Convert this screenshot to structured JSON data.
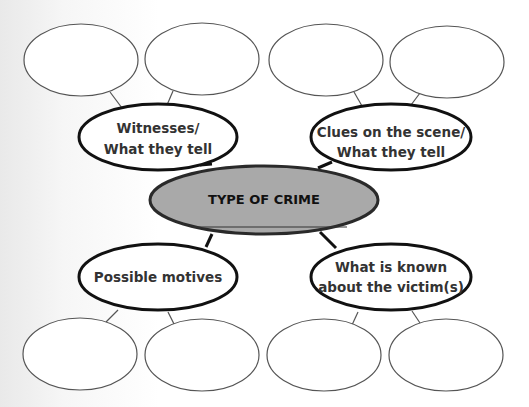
{
  "diagram": {
    "colors": {
      "background": "#ffffff",
      "center_fill": "#a9a9a9",
      "stroke": "#111111",
      "thin_stroke": "#555555",
      "text": "#333333"
    },
    "center": {
      "label": "TYPE OF CRIME",
      "blank_line": true
    },
    "branches": [
      {
        "id": "witnesses",
        "lines": [
          "Witnesses/",
          "What they tell"
        ],
        "sub_nodes": [
          "",
          ""
        ]
      },
      {
        "id": "clues",
        "lines": [
          "Clues on the scene/",
          "What they tell"
        ],
        "sub_nodes": [
          "",
          ""
        ]
      },
      {
        "id": "motives",
        "lines": [
          "Possible motives"
        ],
        "sub_nodes": [
          "",
          ""
        ]
      },
      {
        "id": "victim",
        "lines": [
          "What is known",
          "about the victim(s)"
        ],
        "sub_nodes": [
          "",
          ""
        ]
      }
    ]
  }
}
